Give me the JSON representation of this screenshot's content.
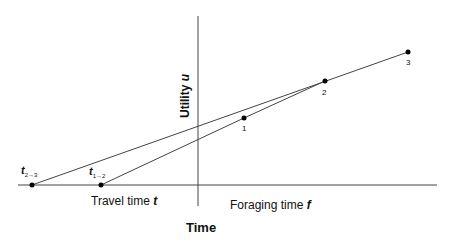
{
  "diagram": {
    "title": "Time",
    "y_axis_label": "Utility",
    "y_axis_var": "u",
    "x_left_label": "Travel time",
    "x_left_var": "t",
    "x_right_label": "Foraging time",
    "x_right_var": "f",
    "travel_points": [
      {
        "name": "t",
        "sub": "2→3"
      },
      {
        "name": "t",
        "sub": "1→2"
      }
    ],
    "patch_points": [
      "1",
      "2",
      "3"
    ],
    "colors": {
      "line": "#444444",
      "point": "#000000"
    }
  }
}
